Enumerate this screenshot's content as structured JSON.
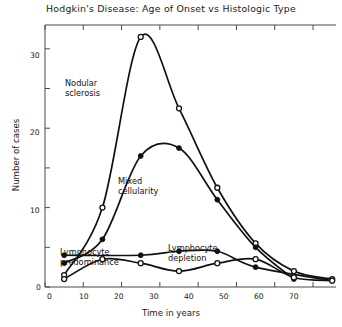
{
  "chart_data": {
    "type": "line",
    "title": "Hodgkin's Disease: Age of Onset vs Histologic Type",
    "xlabel": "Time in years",
    "ylabel": "Number of cases",
    "xlim": [
      0,
      76
    ],
    "ylim": [
      0,
      33
    ],
    "grid": false,
    "legend": "inline-annotations",
    "xticks": [
      0,
      10,
      20,
      30,
      40,
      50,
      60,
      70
    ],
    "xticklabels": [
      "0",
      "10",
      "20",
      "30",
      "40",
      "50",
      "60",
      "70"
    ],
    "yticks": [
      0,
      5,
      10,
      15,
      20,
      25,
      30
    ],
    "yticklabels": [
      "0",
      "",
      "10",
      "",
      "20",
      "",
      "30"
    ],
    "ylabels_shown": [
      "0",
      "10",
      "20",
      "30"
    ],
    "series": [
      {
        "name": "Nodular sclerosis",
        "marker": "open-circle",
        "x": [
          5,
          15,
          25,
          35,
          45,
          55,
          65,
          75
        ],
        "values": [
          1.5,
          10.0,
          31.5,
          22.5,
          12.5,
          5.5,
          2.0,
          1.0
        ]
      },
      {
        "name": "Mixed cellularity",
        "marker": "filled-circle",
        "x": [
          5,
          15,
          25,
          35,
          45,
          55,
          65
        ],
        "values": [
          3.0,
          6.0,
          16.5,
          17.5,
          11.0,
          5.0,
          1.0
        ]
      },
      {
        "name": "Lymphocyte predominance",
        "marker": "filled-circle",
        "x": [
          5,
          25,
          35,
          45,
          55,
          75
        ],
        "values": [
          4.0,
          4.0,
          4.5,
          4.5,
          2.5,
          0.8
        ]
      },
      {
        "name": "Lymphocyte depletion",
        "marker": "open-circle",
        "x": [
          5,
          15,
          25,
          35,
          45,
          55,
          65,
          75
        ],
        "values": [
          1.0,
          3.5,
          3.0,
          2.0,
          3.0,
          3.5,
          1.2,
          0.8
        ]
      }
    ],
    "annotations": [
      {
        "text": "Nodular\nsclerosis",
        "series": "Nodular sclerosis"
      },
      {
        "text": "Mixed\ncellularity",
        "series": "Mixed cellularity"
      },
      {
        "text": "Lymphocyte\npredominance",
        "series": "Lymphocyte predominance"
      },
      {
        "text": "Lymphocyte\ndepletion",
        "series": "Lymphocyte depletion"
      }
    ],
    "colors": {
      "line": "#111111",
      "marker_fill_open": "#ffffff",
      "marker_fill_solid": "#111111",
      "axis": "#3a3a3a",
      "background": "#ffffff"
    }
  }
}
